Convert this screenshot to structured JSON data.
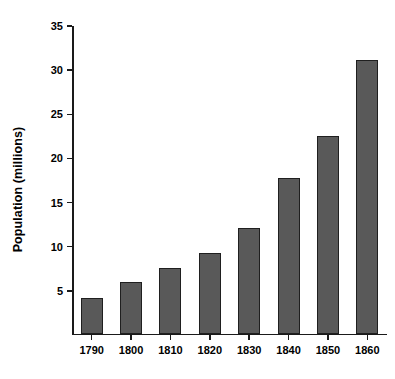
{
  "chart_data": {
    "type": "bar",
    "title": "",
    "xlabel": "",
    "ylabel": "Population (millions)",
    "categories": [
      "1790",
      "1800",
      "1810",
      "1820",
      "1830",
      "1840",
      "1850",
      "1860"
    ],
    "values": [
      4.0,
      5.8,
      7.4,
      9.1,
      12.0,
      17.6,
      22.4,
      31.0
    ],
    "ylim": [
      0,
      35
    ],
    "yticks": [
      5,
      10,
      15,
      20,
      25,
      30,
      35
    ],
    "ytick_labels": [
      "5",
      "10",
      "15",
      "20",
      "25",
      "30",
      "35"
    ],
    "grid": false,
    "legend": false,
    "bar_color": "#595959",
    "bar_edge_color": "#1f1f1f",
    "axis_color": "#1a1a1a",
    "background_color": "#ffffff"
  }
}
